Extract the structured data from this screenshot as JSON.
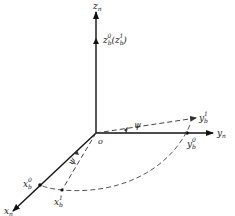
{
  "diagram": {
    "type": "coordinate-frame-rotation",
    "colors": {
      "axis": "#111111",
      "dashed": "#555555",
      "text": "#222222"
    },
    "origin": {
      "label": "o"
    },
    "axes": {
      "z_n": {
        "base": "z",
        "sub": "n"
      },
      "y_n": {
        "base": "y",
        "sub": "n"
      },
      "x_n": {
        "base": "x",
        "sub": "n"
      }
    },
    "points": {
      "z_b0": {
        "base": "z",
        "sub": "b",
        "sup": "0",
        "extra": "(z",
        "extra_sub": "b",
        "extra_sup": "1",
        "extra_close": ")"
      },
      "y_b0": {
        "base": "y",
        "sub": "b",
        "sup": "0"
      },
      "y_b1": {
        "base": "y",
        "sub": "b",
        "sup": "1"
      },
      "x_b0": {
        "base": "x",
        "sub": "b",
        "sup": "0"
      },
      "x_b1": {
        "base": "x",
        "sub": "b",
        "sup": "1"
      }
    },
    "angles": {
      "psi_y": "ψ",
      "psi_x": "ψ"
    }
  }
}
